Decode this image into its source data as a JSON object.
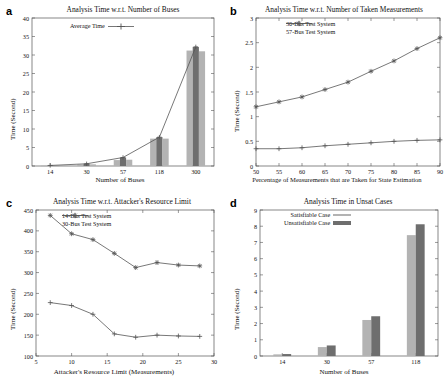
{
  "figure": {
    "panels": [
      "a",
      "b",
      "c",
      "d"
    ]
  },
  "panel_a": {
    "letter": "a",
    "chart_data": {
      "type": "bar",
      "title": "Analysis Time w.r.t. Number of Buses",
      "xlabel": "Number of Buses",
      "ylabel": "Time (Second)",
      "categories": [
        "14",
        "30",
        "57",
        "118",
        "300"
      ],
      "ylim": [
        0,
        40
      ],
      "yticks": [
        0,
        5,
        10,
        15,
        20,
        25,
        30,
        35,
        40
      ],
      "grid": false,
      "legend": [
        {
          "name": "Average Time",
          "marker": "plus",
          "style": "line"
        }
      ],
      "legend_position": "top-center",
      "series": [
        {
          "name": "min",
          "shade": "light",
          "values": [
            0.1,
            0.4,
            1.6,
            7.4,
            31.2
          ]
        },
        {
          "name": "average",
          "shade": "dark",
          "values": [
            0.15,
            0.6,
            2.3,
            7.8,
            32.2
          ]
        },
        {
          "name": "max",
          "shade": "light",
          "values": [
            0.1,
            0.45,
            1.7,
            7.4,
            31.0
          ]
        }
      ],
      "line_series": {
        "name": "Average Time",
        "values": [
          0.15,
          0.6,
          2.3,
          7.8,
          32.2
        ]
      }
    }
  },
  "panel_b": {
    "letter": "b",
    "chart_data": {
      "type": "line",
      "title": "Analysis Time w.r.t. Number of Taken Measurements",
      "xlabel": "Percentage of Measurements that are Taken for State Estimation",
      "ylabel": "Time (Second)",
      "x": [
        50,
        55,
        60,
        65,
        70,
        75,
        80,
        85,
        90
      ],
      "xlim": [
        50,
        90
      ],
      "xticks": [
        50,
        55,
        60,
        65,
        70,
        75,
        80,
        85,
        90
      ],
      "ylim": [
        0,
        3
      ],
      "yticks": [
        "0",
        "0.5",
        "1",
        "1.5",
        "2",
        "2.5",
        "3"
      ],
      "grid": false,
      "legend_position": "top-center",
      "series": [
        {
          "name": "30-Bus Test System",
          "marker": "plus",
          "values": [
            0.35,
            0.35,
            0.37,
            0.41,
            0.44,
            0.47,
            0.5,
            0.52,
            0.53
          ]
        },
        {
          "name": "57-Bus Test System",
          "marker": "star",
          "values": [
            1.2,
            1.3,
            1.4,
            1.55,
            1.7,
            1.92,
            2.13,
            2.38,
            2.6
          ]
        }
      ]
    }
  },
  "panel_c": {
    "letter": "c",
    "chart_data": {
      "type": "line",
      "title": "Analysis Time w.r.t. Attacker's Resource Limit",
      "xlabel": "Attacker's Resource Limit (Measurements)",
      "ylabel": "Time (Second)",
      "x": [
        7,
        10,
        13,
        16,
        19,
        22,
        25,
        28
      ],
      "xlim": [
        5,
        30
      ],
      "xticks": [
        5,
        10,
        15,
        20,
        25,
        30
      ],
      "ylim": [
        100,
        450
      ],
      "yticks": [
        100,
        150,
        200,
        250,
        300,
        350,
        400,
        450
      ],
      "grid": false,
      "legend_position": "top-center",
      "series": [
        {
          "name": "14-Bus Test System",
          "marker": "plus",
          "values": [
            228,
            221,
            200,
            153,
            145,
            150,
            148,
            147
          ]
        },
        {
          "name": "30-Bus Test System",
          "marker": "star",
          "values": [
            437,
            393,
            379,
            346,
            312,
            324,
            318,
            316
          ]
        }
      ]
    }
  },
  "panel_d": {
    "letter": "d",
    "chart_data": {
      "type": "bar",
      "title": "Analysis Time in Unsat Cases",
      "xlabel": "Number of Buses",
      "ylabel": "Time (Second)",
      "categories": [
        "14",
        "30",
        "57",
        "118"
      ],
      "ylim": [
        0,
        9
      ],
      "yticks": [
        0,
        1,
        2,
        3,
        4,
        5,
        6,
        7,
        8,
        9
      ],
      "grid": false,
      "legend_position": "top-center",
      "series": [
        {
          "name": "Satisfiable Case",
          "shade": "light",
          "values": [
            0.1,
            0.55,
            2.22,
            7.45
          ]
        },
        {
          "name": "Unsatisfiable Case",
          "shade": "dark",
          "values": [
            0.12,
            0.65,
            2.45,
            8.12
          ]
        }
      ]
    }
  },
  "colors": {
    "bar_light": "#b3b3b3",
    "bar_dark": "#6e6e6e",
    "axis": "#555555",
    "line": "#555555",
    "text": "#111111"
  }
}
